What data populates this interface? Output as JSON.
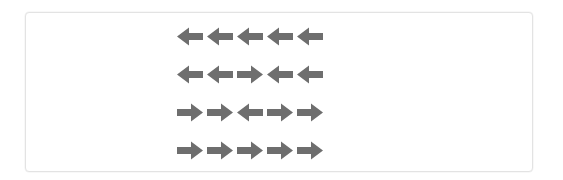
{
  "panel": {
    "name": "flanker-stimulus-panel",
    "background_color": "#ffffff",
    "border_color": "#e3e3e3"
  },
  "stimulus": {
    "arrow_color": "#6e6e6e",
    "rows_count": 4,
    "arrows_per_row": 5,
    "rows": [
      {
        "index": 1,
        "directions": [
          "left",
          "left",
          "left",
          "left",
          "left"
        ],
        "target_direction": "left",
        "flanker_direction": "left",
        "condition": "congruent"
      },
      {
        "index": 2,
        "directions": [
          "left",
          "left",
          "right",
          "left",
          "left"
        ],
        "target_direction": "right",
        "flanker_direction": "left",
        "condition": "incongruent"
      },
      {
        "index": 3,
        "directions": [
          "right",
          "right",
          "left",
          "right",
          "right"
        ],
        "target_direction": "left",
        "flanker_direction": "right",
        "condition": "incongruent"
      },
      {
        "index": 4,
        "directions": [
          "right",
          "right",
          "right",
          "right",
          "right"
        ],
        "target_direction": "right",
        "flanker_direction": "right",
        "condition": "congruent"
      }
    ],
    "icon_names": {
      "left": "arrow-left-icon",
      "right": "arrow-right-icon"
    }
  }
}
